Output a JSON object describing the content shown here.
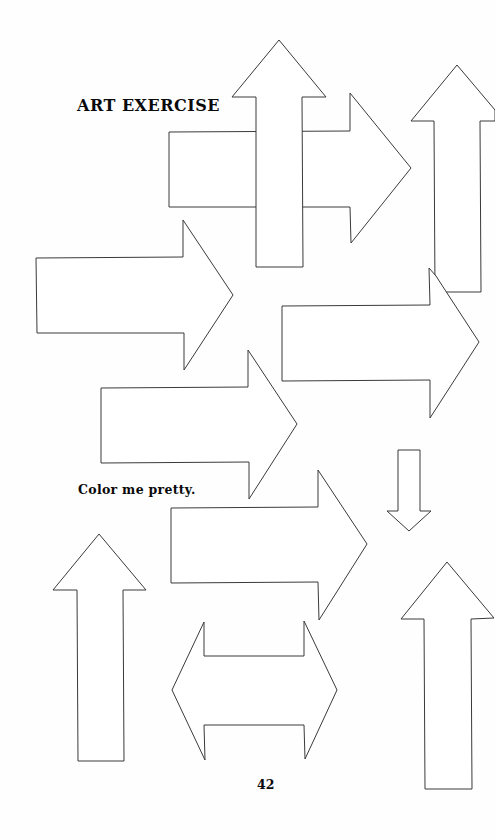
{
  "page": {
    "title": "ART EXERCISE",
    "instruction": "Color me pretty.",
    "page_number": "42"
  },
  "colors": {
    "background": "#fefefe",
    "outline": "#3a3a3a",
    "text": "#0a0a0a"
  },
  "shapes": [
    {
      "type": "arrow",
      "direction": "right",
      "label": "arrow-right-top"
    },
    {
      "type": "arrow",
      "direction": "up",
      "label": "arrow-up-top-center"
    },
    {
      "type": "arrow",
      "direction": "up",
      "label": "arrow-up-top-right"
    },
    {
      "type": "arrow",
      "direction": "right",
      "label": "arrow-right-left-middle"
    },
    {
      "type": "arrow",
      "direction": "right",
      "label": "arrow-right-right-middle"
    },
    {
      "type": "arrow",
      "direction": "right",
      "label": "arrow-right-center"
    },
    {
      "type": "arrow",
      "direction": "down",
      "label": "arrow-down-small"
    },
    {
      "type": "arrow",
      "direction": "right",
      "label": "arrow-right-lower"
    },
    {
      "type": "arrow",
      "direction": "up",
      "label": "arrow-up-bottom-left"
    },
    {
      "type": "arrow",
      "direction": "left-right",
      "label": "arrow-double-horizontal"
    },
    {
      "type": "arrow",
      "direction": "up",
      "label": "arrow-up-bottom-right"
    }
  ]
}
